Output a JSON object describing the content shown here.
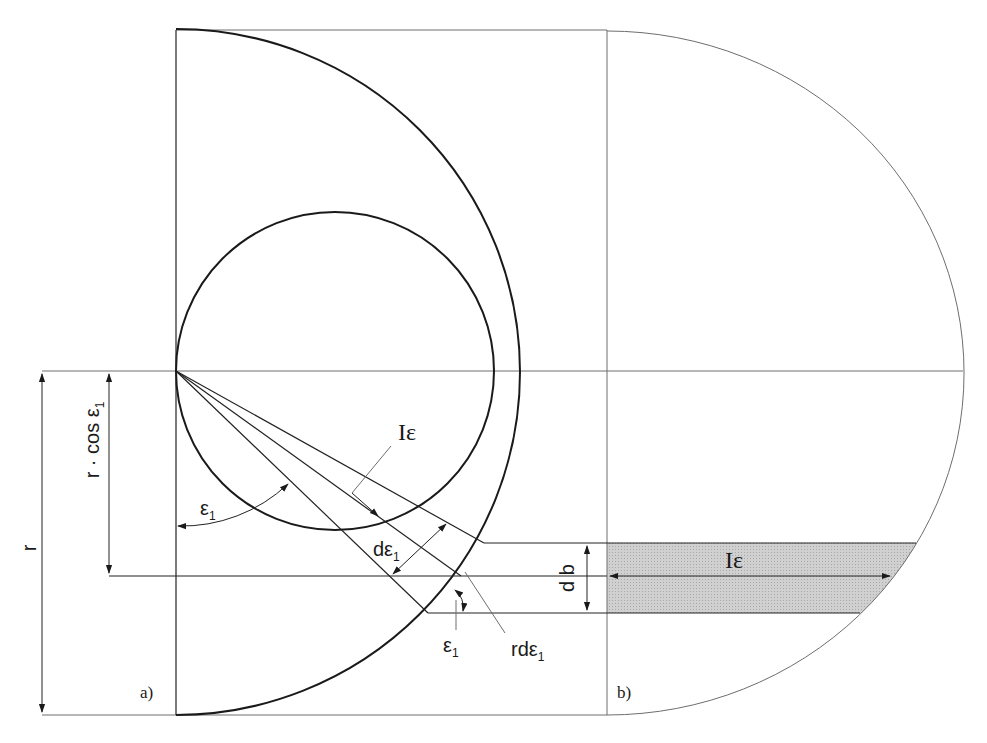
{
  "figure": {
    "panels": [
      {
        "id": "a",
        "label": "a)"
      },
      {
        "id": "b",
        "label": "b)"
      }
    ],
    "labels": {
      "radius": "r",
      "r_cos": "r · cos ε",
      "r_cos_sub": "1",
      "epsilon": "ε",
      "epsilon_sub": "1",
      "l_epsilon_main": "I",
      "l_epsilon_sub": "ε",
      "d_epsilon": "dε",
      "d_epsilon_sub": "1",
      "db": "d b",
      "r_d_epsilon": "rdε",
      "r_d_epsilon_sub": "1",
      "epsilon_lower": "ε",
      "epsilon_lower_sub": "1",
      "l_epsilon_b_main": "I",
      "l_epsilon_b_sub": "ε"
    },
    "colors": {
      "shaded_strip": "#c8c8c8",
      "line": "#1a1a1a",
      "thin_line": "#6e6e6e"
    }
  }
}
